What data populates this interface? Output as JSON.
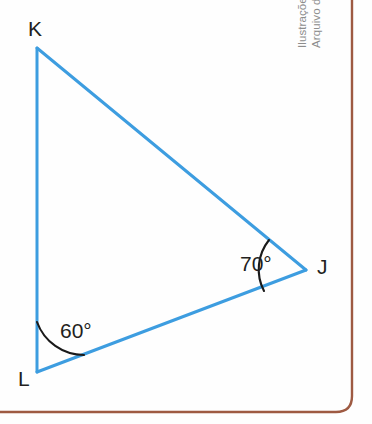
{
  "figure": {
    "name": "triangle-klj-angles",
    "background_color": "#fefefe",
    "stroke_color": "#3d9de0",
    "arc_color": "#1a1a1a",
    "label_color": "#231f20",
    "frame_color": "#9e5a42"
  },
  "triangle": {
    "vertices": [
      {
        "id": "K",
        "label": "K",
        "x": 37,
        "y": 48
      },
      {
        "id": "L",
        "label": "L",
        "x": 37,
        "y": 372
      },
      {
        "id": "J",
        "label": "J",
        "x": 306,
        "y": 270
      }
    ],
    "sides": [
      {
        "from": "K",
        "to": "L"
      },
      {
        "from": "K",
        "to": "J"
      },
      {
        "from": "L",
        "to": "J"
      }
    ]
  },
  "angles": [
    {
      "at": "L",
      "label": "60°",
      "value": 60,
      "unit": "degrees"
    },
    {
      "at": "J",
      "label": "70°",
      "value": 70,
      "unit": "degrees"
    }
  ],
  "credit": {
    "line1": "Ilustrações: Banco de imagens/",
    "line2": "Arquivo da editora"
  }
}
